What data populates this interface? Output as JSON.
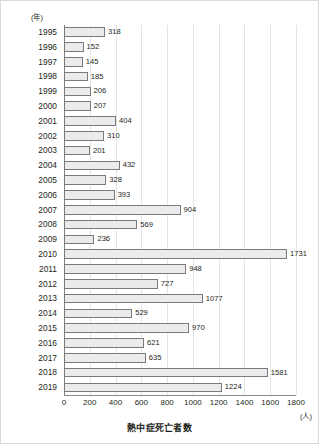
{
  "chart_data": {
    "type": "bar",
    "orientation": "horizontal",
    "title": "",
    "xlabel": "熱中症死亡者数",
    "ylabel": "(年)",
    "xunit": "(人)",
    "xlim": [
      0,
      1800
    ],
    "xticks": [
      0,
      200,
      400,
      600,
      800,
      1000,
      1200,
      1400,
      1600,
      1800
    ],
    "grid": true,
    "legend": false,
    "categories": [
      "1995",
      "1996",
      "1997",
      "1998",
      "1999",
      "2000",
      "2001",
      "2002",
      "2003",
      "2004",
      "2005",
      "2006",
      "2007",
      "2008",
      "2009",
      "2010",
      "2011",
      "2012",
      "2013",
      "2014",
      "2015",
      "2016",
      "2017",
      "2018",
      "2019"
    ],
    "values": [
      318,
      152,
      145,
      185,
      206,
      207,
      404,
      310,
      201,
      432,
      328,
      393,
      904,
      569,
      236,
      1731,
      948,
      727,
      1077,
      529,
      970,
      621,
      635,
      1581,
      1224
    ],
    "bar_fill": "#ebebeb",
    "bar_stroke": "#7a7a7a",
    "grid_color": "#e4e4e4",
    "axis_color": "#808080",
    "text_color": "#231f20"
  }
}
